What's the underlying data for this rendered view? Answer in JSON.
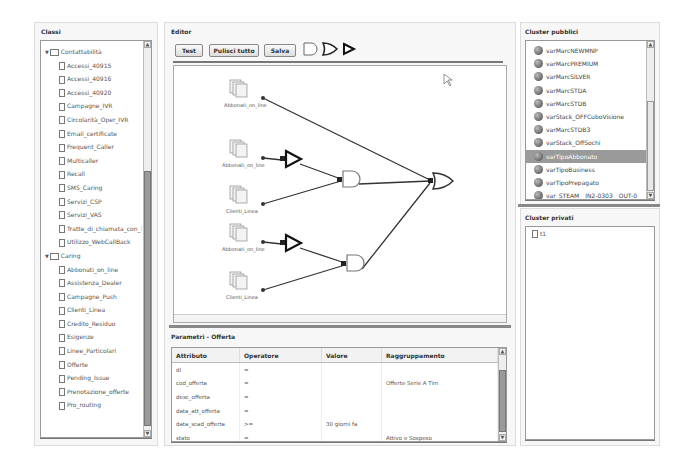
{
  "classi": {
    "title": "Classi",
    "groups": [
      {
        "label": "Contattabilità",
        "items": [
          "Accessi_40915",
          "Accessi_40916",
          "Accessi_40920",
          "Campagne_IVR",
          "Circolarità_Oper_IVR",
          "Email_certificate",
          "Frequent_Caller",
          "Multicaller",
          "Recall",
          "SMS_Caring",
          "Servizi_CSP",
          "Servizi_VAS",
          "Tratte_di_chiamata_con_?",
          "Utilizzo_WebCallBack"
        ]
      },
      {
        "label": "Caring",
        "items": [
          "Abbonati_on_line",
          "Assistenza_Dealer",
          "Campagne_Push",
          "Clienti_Linea",
          "Credito_Residuo",
          "Esigenze",
          "Linee_Particolari",
          "Offerte",
          "Pending_Issue",
          "Prenotazione_offerte",
          "Pro_routing"
        ]
      }
    ]
  },
  "editor": {
    "title": "Editor",
    "buttons": {
      "test": "Test",
      "clear": "Pulisci tutto",
      "save": "Salva"
    },
    "tools": [
      "and-gate-tool",
      "or-gate-tool",
      "not-gate-tool"
    ],
    "nodes": [
      {
        "label": "Abbonati_on_line"
      },
      {
        "label": "Abbonati_on_line"
      },
      {
        "label": "Clienti_Linea"
      },
      {
        "label": "Abbonati_on_line"
      },
      {
        "label": "Clienti_Linea"
      }
    ]
  },
  "params": {
    "title": "Parametri - Offerta",
    "columns": [
      "Attributo",
      "Operatore",
      "Valore",
      "Raggruppamento"
    ],
    "rows": [
      [
        "dl",
        "=",
        "",
        ""
      ],
      [
        "cod_offerta",
        "=",
        "",
        "Offerte Serie A Tim"
      ],
      [
        "desc_offerta",
        "=",
        "",
        ""
      ],
      [
        "data_att_offerta",
        "=",
        "",
        ""
      ],
      [
        "data_scad_offerta",
        ">=",
        "30 giorni fa",
        ""
      ],
      [
        "stato",
        "=",
        "",
        "Attivo e Sospeso"
      ],
      [
        "canone",
        "=",
        "",
        ""
      ]
    ]
  },
  "cluster_pubblici": {
    "title": "Cluster pubblici",
    "items": [
      "varMarcNEWMNP",
      "varMarcPREMIUM",
      "varMarcSILVER",
      "varMarcSTDA",
      "varMarcSTDB",
      "varStack_OFFCuboVisione",
      "varMarcSTDB3",
      "varStack_OffSochi",
      "varTipoAbbonato",
      "varTipoBusiness",
      "varTipoPrepagato",
      "var_STEAM__IN2-0303__OUT-0",
      "var_STEAM__IN2-0303__OUT-1"
    ],
    "selected_index": 8
  },
  "cluster_privati": {
    "title": "Cluster privati",
    "items": [
      "t1"
    ]
  }
}
